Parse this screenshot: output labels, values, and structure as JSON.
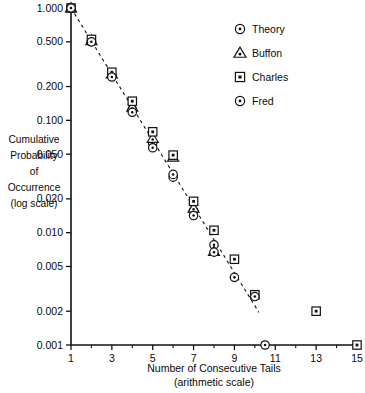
{
  "chart_data": {
    "type": "scatter",
    "title": "",
    "xlabel": "Number of Consecutive Tails",
    "xlabel_sub": "(arithmetic scale)",
    "ylabel_lines": [
      "Cumulative",
      "Probability",
      "of",
      "Occurrence",
      "(log scale)"
    ],
    "yscale": "log",
    "ylim": [
      0.001,
      1.0
    ],
    "xlim": [
      1,
      15
    ],
    "grid": false,
    "legend_position": "top-right",
    "ytick_values": [
      1.0,
      0.5,
      0.2,
      0.1,
      0.05,
      0.02,
      0.01,
      0.005,
      0.002,
      0.001
    ],
    "ytick_labels": [
      "1.000",
      "0.500",
      "0.200",
      "0.100",
      "0.050",
      "0.020",
      "0.010",
      "0.005",
      "0.002",
      "0.001"
    ],
    "xtick_values": [
      1,
      3,
      5,
      7,
      9,
      11,
      13,
      15
    ],
    "xtick_labels": [
      "1",
      "3",
      "5",
      "7",
      "9",
      "11",
      "13",
      "15"
    ],
    "xtick_minor_values": [
      2,
      4,
      6,
      8,
      10,
      12,
      14
    ],
    "series": [
      {
        "name": "Theory",
        "marker": "circle-dot",
        "points": [
          {
            "x": 1,
            "y": 1.0
          },
          {
            "x": 2,
            "y": 0.5
          },
          {
            "x": 3,
            "y": 0.25
          },
          {
            "x": 4,
            "y": 0.125
          },
          {
            "x": 5,
            "y": 0.0625
          },
          {
            "x": 6,
            "y": 0.0312
          },
          {
            "x": 7,
            "y": 0.0156
          },
          {
            "x": 8,
            "y": 0.0078
          }
        ]
      },
      {
        "name": "Buffon",
        "marker": "triangle-dot",
        "points": [
          {
            "x": 1,
            "y": 1.0
          },
          {
            "x": 2,
            "y": 0.512
          },
          {
            "x": 3,
            "y": 0.258
          },
          {
            "x": 4,
            "y": 0.131
          },
          {
            "x": 5,
            "y": 0.069
          },
          {
            "x": 6,
            "y": 0.047
          },
          {
            "x": 7,
            "y": 0.0165
          },
          {
            "x": 8,
            "y": 0.0068
          }
        ]
      },
      {
        "name": "Charles",
        "marker": "square-dot",
        "points": [
          {
            "x": 1,
            "y": 1.0
          },
          {
            "x": 2,
            "y": 0.525
          },
          {
            "x": 3,
            "y": 0.268
          },
          {
            "x": 4,
            "y": 0.148
          },
          {
            "x": 5,
            "y": 0.079
          },
          {
            "x": 6,
            "y": 0.049
          },
          {
            "x": 7,
            "y": 0.019
          },
          {
            "x": 8,
            "y": 0.0105
          },
          {
            "x": 9,
            "y": 0.0058
          },
          {
            "x": 10,
            "y": 0.0028
          },
          {
            "x": 13,
            "y": 0.002
          },
          {
            "x": 15,
            "y": 0.001
          }
        ]
      },
      {
        "name": "Fred",
        "marker": "circle-dot",
        "points": [
          {
            "x": 1,
            "y": 1.0
          },
          {
            "x": 2,
            "y": 0.5
          },
          {
            "x": 3,
            "y": 0.243
          },
          {
            "x": 4,
            "y": 0.118
          },
          {
            "x": 5,
            "y": 0.057
          },
          {
            "x": 6,
            "y": 0.033
          },
          {
            "x": 7,
            "y": 0.0142
          },
          {
            "x": 8,
            "y": 0.0067
          },
          {
            "x": 9,
            "y": 0.004
          },
          {
            "x": 10,
            "y": 0.0027
          },
          {
            "x": 10.5,
            "y": 0.001
          }
        ]
      }
    ],
    "theory_line": {
      "description": "dashed straight reference line from (1, 1.0) to (10.2, 0.00195)",
      "x_start": 1,
      "y_start": 1.0,
      "x_end": 10.2,
      "y_end": 0.00195
    },
    "legend": [
      {
        "label": "Theory",
        "marker": "circle-dot"
      },
      {
        "label": "Buffon",
        "marker": "triangle-dot"
      },
      {
        "label": "Charles",
        "marker": "square-dot"
      },
      {
        "label": "Fred",
        "marker": "circle-dot"
      }
    ]
  }
}
